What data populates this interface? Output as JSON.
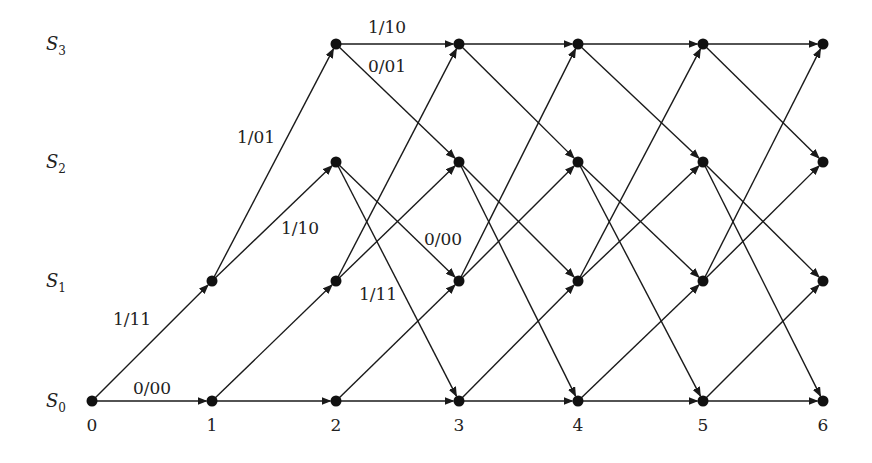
{
  "diagram": {
    "type": "trellis",
    "states": [
      {
        "name": "S",
        "sub": "0",
        "y": 401
      },
      {
        "name": "S",
        "sub": "1",
        "y": 281
      },
      {
        "name": "S",
        "sub": "2",
        "y": 162
      },
      {
        "name": "S",
        "sub": "3",
        "y": 44
      }
    ],
    "stages": [
      {
        "label": "0",
        "x": 92
      },
      {
        "label": "1",
        "x": 212
      },
      {
        "label": "2",
        "x": 336
      },
      {
        "label": "3",
        "x": 459
      },
      {
        "label": "4",
        "x": 578
      },
      {
        "label": "5",
        "x": 703
      },
      {
        "label": "6",
        "x": 823
      }
    ],
    "transitions": [
      {
        "from": 0,
        "to": 0,
        "label": "0/00"
      },
      {
        "from": 0,
        "to": 1,
        "label": "1/11"
      },
      {
        "from": 1,
        "to": 2,
        "label": "1/10"
      },
      {
        "from": 1,
        "to": 3,
        "label": "1/01"
      },
      {
        "from": 2,
        "to": 0,
        "label": "1/11"
      },
      {
        "from": 2,
        "to": 1,
        "label": "0/00"
      },
      {
        "from": 3,
        "to": 2,
        "label": "0/01"
      },
      {
        "from": 3,
        "to": 3,
        "label": "1/10"
      }
    ],
    "edge_labels": [
      {
        "text": "0/00",
        "x": 152,
        "y": 394
      },
      {
        "text": "1/11",
        "x": 132,
        "y": 325
      },
      {
        "text": "1/10",
        "x": 300,
        "y": 234
      },
      {
        "text": "1/01",
        "x": 256,
        "y": 143
      },
      {
        "text": "1/10",
        "x": 387,
        "y": 33
      },
      {
        "text": "0/01",
        "x": 387,
        "y": 72
      },
      {
        "text": "0/00",
        "x": 443,
        "y": 245
      },
      {
        "text": "1/11",
        "x": 378,
        "y": 300
      }
    ]
  }
}
